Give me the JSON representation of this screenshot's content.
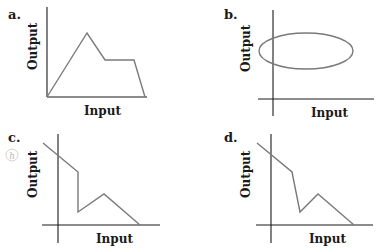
{
  "panels": [
    {
      "id": "a",
      "label": "a.",
      "xlabel": "Input",
      "ylabel": "Output",
      "shape": "polyline",
      "points": "47,97 87,33 105,60 134,60 145,97"
    },
    {
      "id": "b",
      "label": "b.",
      "xlabel": "Input",
      "ylabel": "Output",
      "shape": "ellipse",
      "ellipse": {
        "cx": 306,
        "cy": 51,
        "rx": 47,
        "ry": 18
      }
    },
    {
      "id": "c",
      "label": "c.",
      "xlabel": "Input",
      "ylabel": "Output",
      "shape": "polyline",
      "points": "43,143 78,172 78,212 104,194 140,225",
      "hint_icon": "h"
    },
    {
      "id": "d",
      "label": "d.",
      "xlabel": "Input",
      "ylabel": "Output",
      "shape": "polyline",
      "points": "257,143 292,172 300,212 318,194 354,225"
    }
  ],
  "colors": {
    "axis": "#1a1a1a",
    "curve": "#7a7a7a",
    "hint": "#b8b8b8"
  }
}
